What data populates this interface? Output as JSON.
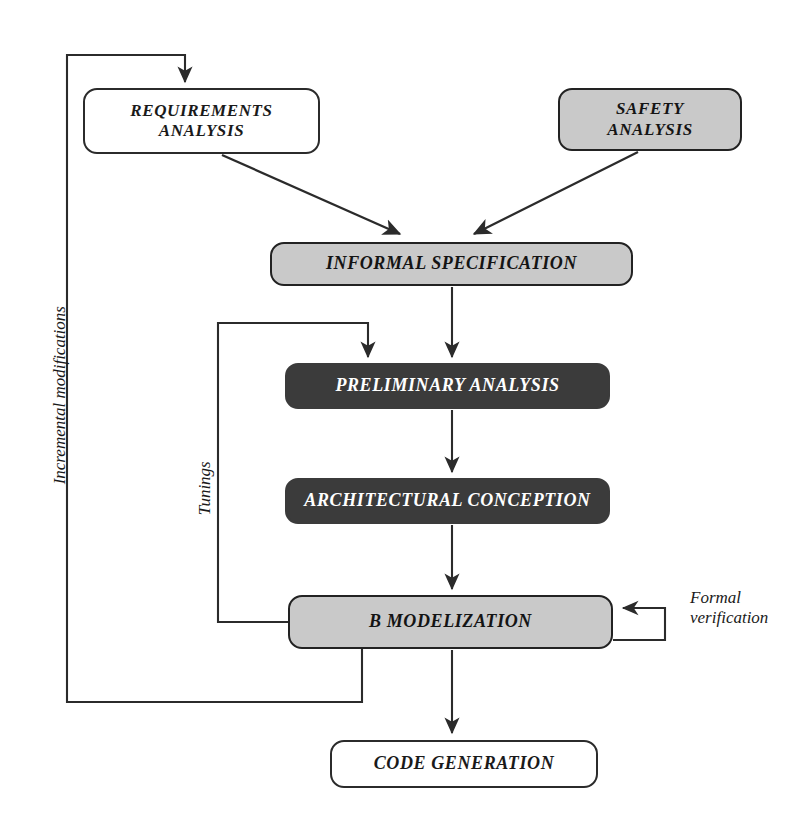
{
  "diagram": {
    "colors": {
      "stroke": "#2b2b2b",
      "white_fill": "#ffffff",
      "gray_fill": "#c9c9c9",
      "dark_fill": "#3b3b3b",
      "dark_text": "#ffffff",
      "light_text": "#141414"
    },
    "nodes": [
      {
        "id": "requirements-analysis",
        "label": "REQUIREMENTS\nANALYSIS",
        "line1": "REQUIREMENTS",
        "line2": "ANALYSIS",
        "style": "white",
        "x": 83,
        "y": 88,
        "w": 237,
        "h": 66,
        "font_size": 17
      },
      {
        "id": "safety-analysis",
        "label": "SAFETY\nANALYSIS",
        "line1": "SAFETY",
        "line2": "ANALYSIS",
        "style": "gray",
        "x": 558,
        "y": 88,
        "w": 184,
        "h": 63,
        "font_size": 17
      },
      {
        "id": "informal-specification",
        "label": "INFORMAL SPECIFICATION",
        "style": "gray",
        "x": 270,
        "y": 242,
        "w": 363,
        "h": 44,
        "font_size": 18
      },
      {
        "id": "preliminary-analysis",
        "label": "PRELIMINARY ANALYSIS",
        "style": "dark",
        "x": 285,
        "y": 363,
        "w": 325,
        "h": 46,
        "font_size": 18
      },
      {
        "id": "architectural-conception",
        "label": "ARCHITECTURAL CONCEPTION",
        "style": "dark",
        "x": 285,
        "y": 478,
        "w": 325,
        "h": 46,
        "font_size": 18
      },
      {
        "id": "b-modelization",
        "label": "B MODELIZATION",
        "style": "gray",
        "x": 288,
        "y": 595,
        "w": 325,
        "h": 54,
        "font_size": 18
      },
      {
        "id": "code-generation",
        "label": "CODE GENERATION",
        "style": "white",
        "x": 330,
        "y": 740,
        "w": 268,
        "h": 48,
        "font_size": 18
      }
    ],
    "edge_labels": [
      {
        "id": "incremental-modifications",
        "text": "Incremental modifications",
        "orientation": "vertical",
        "x": 52,
        "y": 390,
        "font_size": 17
      },
      {
        "id": "tunings",
        "text": "Tunings",
        "orientation": "vertical",
        "x": 205,
        "y": 490,
        "font_size": 17
      },
      {
        "id": "formal-verification",
        "text": "Formal\nverification",
        "line1": "Formal",
        "line2": "verification",
        "orientation": "horizontal",
        "x": 700,
        "y": 596,
        "font_size": 17
      }
    ],
    "edges": [
      {
        "id": "requirements-to-informal",
        "from": "requirements-analysis",
        "to": "informal-specification",
        "kind": "diagonal-arrow"
      },
      {
        "id": "safety-to-informal",
        "from": "safety-analysis",
        "to": "informal-specification",
        "kind": "diagonal-arrow"
      },
      {
        "id": "informal-to-preliminary",
        "from": "informal-specification",
        "to": "preliminary-analysis",
        "kind": "straight-arrow"
      },
      {
        "id": "preliminary-to-architectural",
        "from": "preliminary-analysis",
        "to": "architectural-conception",
        "kind": "straight-arrow"
      },
      {
        "id": "architectural-to-bmodel",
        "from": "architectural-conception",
        "to": "b-modelization",
        "kind": "straight-arrow"
      },
      {
        "id": "bmodel-to-code",
        "from": "b-modelization",
        "to": "code-generation",
        "kind": "straight-arrow"
      },
      {
        "id": "tunings-loop",
        "from": "b-modelization",
        "to": "preliminary-analysis",
        "kind": "orthogonal-feedback",
        "label": "Tunings"
      },
      {
        "id": "incremental-loop",
        "from": "b-modelization",
        "to": "requirements-analysis",
        "kind": "orthogonal-feedback",
        "label": "Incremental modifications"
      },
      {
        "id": "formal-verification-loop",
        "from": "b-modelization",
        "to": "b-modelization",
        "kind": "self-loop",
        "label": "Formal verification"
      }
    ]
  }
}
